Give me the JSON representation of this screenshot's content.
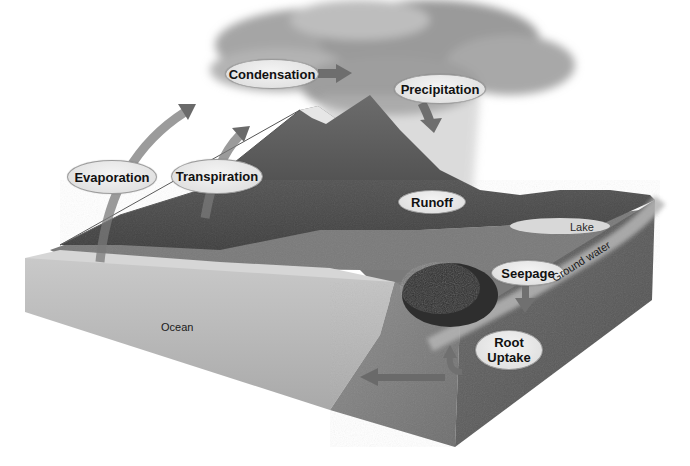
{
  "diagram": {
    "title": "",
    "type": "water-cycle",
    "process_labels": {
      "condensation": "Condensation",
      "precipitation": "Precipitation",
      "evaporation": "Evaporation",
      "transpiration": "Transpiration",
      "runoff": "Runoff",
      "seepage": "Seepage",
      "root_uptake": "Root\nUptake"
    },
    "region_labels": {
      "ocean": "Ocean",
      "lake": "Lake",
      "ground_water": "Ground water"
    },
    "colors": {
      "background": "#ffffff",
      "arrow": "#6e6e6e",
      "label_fill": "#e6e6e6",
      "label_border": "#9a9a9a",
      "ocean": "#b9b9b9",
      "soil": "#7a7a7a",
      "cloud": "#9c9c9c",
      "mountain": "#5a5a5a"
    }
  }
}
